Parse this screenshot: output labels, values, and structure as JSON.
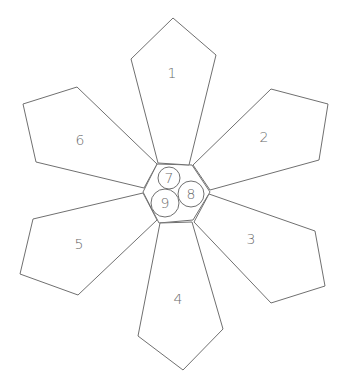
{
  "diagram": {
    "stroke_color": "#707070",
    "label_color": "#6a6a6a",
    "background": "#ffffff",
    "center_hexagon": {
      "points": "157,164 192,165 210,192 193,220 159,223 143,192"
    },
    "petals": [
      {
        "id": 1,
        "label": "1",
        "points": "158,163 131,59 173,18 216,55 189,165",
        "label_pos": [
          172,
          73
        ]
      },
      {
        "id": 2,
        "label": "2",
        "points": "193,165 271,89 328,104 319,160 210,190",
        "label_pos": [
          264,
          137
        ]
      },
      {
        "id": 3,
        "label": "3",
        "points": "209,194 315,231 325,286 271,303 194,222",
        "label_pos": [
          251,
          239
        ]
      },
      {
        "id": 4,
        "label": "4",
        "points": "160,223 192,222 223,329 183,370 138,336",
        "label_pos": [
          178,
          299
        ]
      },
      {
        "id": 5,
        "label": "5",
        "points": "143,193 33,219 20,274 78,295 157,220",
        "label_pos": [
          79,
          244
        ]
      },
      {
        "id": 6,
        "label": "6",
        "points": "157,164 77,87 23,104 36,162 144,188",
        "label_pos": [
          80,
          140
        ]
      }
    ],
    "circles": [
      {
        "id": 7,
        "label": "7",
        "cx": 169,
        "cy": 178,
        "r": 11
      },
      {
        "id": 8,
        "label": "8",
        "cx": 191,
        "cy": 194,
        "r": 13
      },
      {
        "id": 9,
        "label": "9",
        "cx": 165,
        "cy": 203,
        "r": 14
      }
    ]
  }
}
